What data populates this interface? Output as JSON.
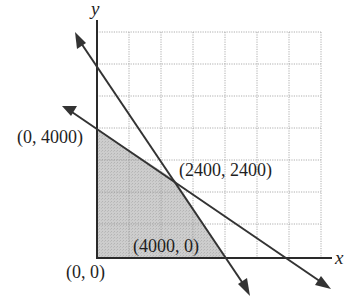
{
  "diagram": {
    "type": "linear-programming-feasible-region",
    "axes": {
      "x_label": "x",
      "y_label": "y"
    },
    "grid": {
      "columns": 7,
      "rows": 7,
      "unit_per_cell": 1000
    },
    "colors": {
      "region_fill": "#c8c8c8",
      "lines": "#333333",
      "grid": "#9a9a9a"
    },
    "points": [
      {
        "id": "origin",
        "label": "(0, 0)",
        "x": 0,
        "y": 0
      },
      {
        "id": "y-intercept",
        "label": "(0, 4000)",
        "x": 0,
        "y": 4000
      },
      {
        "id": "intersection",
        "label": "(2400, 2400)",
        "x": 2400,
        "y": 2400
      },
      {
        "id": "x-intercept",
        "label": "(4000, 0)",
        "x": 4000,
        "y": 0
      }
    ],
    "lines": [
      {
        "id": "steep-line",
        "through": [
          [
            0,
            6000
          ],
          [
            4000,
            0
          ]
        ]
      },
      {
        "id": "shallow-line",
        "through": [
          [
            0,
            4000
          ],
          [
            6000,
            0
          ]
        ]
      }
    ],
    "shaded_region_vertices": [
      [
        0,
        0
      ],
      [
        0,
        4000
      ],
      [
        2400,
        2400
      ],
      [
        4000,
        0
      ]
    ]
  }
}
